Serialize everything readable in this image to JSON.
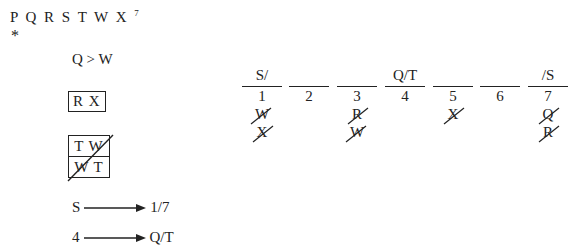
{
  "header": {
    "letters": "P Q R S T W X",
    "count_superscript": "7",
    "marker": "*"
  },
  "rules": {
    "ordering": "Q > W",
    "block_together": "R X",
    "block_crossed": {
      "top": "T W",
      "bottom": "W T",
      "crossed_out": true
    },
    "arrows": [
      {
        "from": "S",
        "to": "1/7"
      },
      {
        "from": "4",
        "to": "Q/T"
      }
    ]
  },
  "slots": [
    {
      "number": "1",
      "above": "S/",
      "eliminated": [
        "W",
        "X"
      ]
    },
    {
      "number": "2",
      "above": "",
      "eliminated": []
    },
    {
      "number": "3",
      "above": "",
      "eliminated": [
        "R",
        "W"
      ]
    },
    {
      "number": "4",
      "above": "Q/T",
      "eliminated": []
    },
    {
      "number": "5",
      "above": "",
      "eliminated": [
        "X"
      ]
    },
    {
      "number": "6",
      "above": "",
      "eliminated": []
    },
    {
      "number": "7",
      "above": "/S",
      "eliminated": [
        "Q",
        "R"
      ]
    }
  ]
}
